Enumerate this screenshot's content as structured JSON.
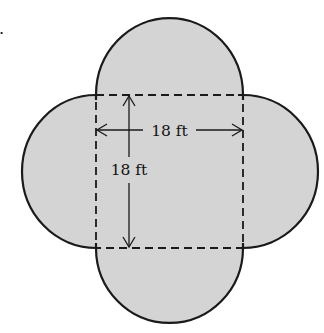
{
  "figure": {
    "part_marker": ".",
    "square": {
      "side_label_horizontal": "18 ft",
      "side_label_vertical": "18 ft"
    },
    "colors": {
      "fill": "#d4d4d4",
      "stroke": "#1a1a1a",
      "background": "#ffffff"
    },
    "square_edges_style": "dashed",
    "semicircle_count": 4
  }
}
